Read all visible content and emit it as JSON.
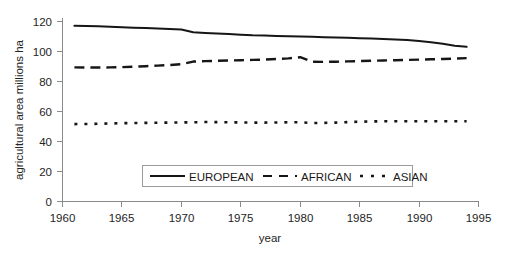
{
  "chart_data": {
    "type": "line",
    "title": "",
    "xlabel": "year",
    "ylabel": "agricultural area  millions ha",
    "xlim": [
      1960,
      1995
    ],
    "ylim": [
      0,
      120
    ],
    "xticks": [
      1960,
      1965,
      1970,
      1975,
      1980,
      1985,
      1990,
      1995
    ],
    "yticks": [
      0,
      20,
      40,
      60,
      80,
      100,
      120
    ],
    "grid": false,
    "legend_position": "lower-center-inside",
    "x": [
      1961,
      1962,
      1963,
      1964,
      1965,
      1966,
      1967,
      1968,
      1969,
      1970,
      1971,
      1972,
      1973,
      1974,
      1975,
      1976,
      1977,
      1978,
      1979,
      1980,
      1981,
      1982,
      1983,
      1984,
      1985,
      1986,
      1987,
      1988,
      1989,
      1990,
      1991,
      1992,
      1993,
      1994
    ],
    "series": [
      {
        "name": "EUROPEAN",
        "style": "solid",
        "values": [
          117.2,
          117.0,
          116.8,
          116.5,
          116.2,
          115.9,
          115.6,
          115.3,
          115.0,
          114.6,
          112.9,
          112.4,
          112.0,
          111.6,
          111.2,
          110.8,
          110.6,
          110.4,
          110.2,
          110.0,
          109.8,
          109.5,
          109.3,
          109.1,
          108.9,
          108.6,
          108.3,
          108.0,
          107.6,
          107.0,
          106.2,
          105.2,
          103.8,
          103.1
        ]
      },
      {
        "name": "AFRICAN",
        "style": "dashed",
        "values": [
          89.4,
          89.3,
          89.3,
          89.4,
          89.6,
          89.9,
          90.2,
          90.6,
          91.0,
          91.5,
          93.3,
          93.6,
          93.8,
          94.0,
          94.2,
          94.4,
          94.6,
          95.0,
          95.4,
          96.2,
          93.2,
          93.1,
          93.2,
          93.4,
          93.6,
          93.8,
          94.0,
          94.2,
          94.4,
          94.6,
          94.8,
          95.0,
          95.3,
          95.6
        ]
      },
      {
        "name": "ASIAN",
        "style": "dotted",
        "values": [
          51.6,
          51.7,
          51.8,
          52.0,
          52.2,
          52.3,
          52.4,
          52.5,
          52.6,
          52.7,
          52.8,
          53.0,
          52.9,
          52.8,
          52.7,
          52.6,
          52.6,
          52.7,
          52.8,
          52.9,
          52.3,
          52.4,
          52.6,
          52.9,
          53.2,
          53.4,
          53.5,
          53.5,
          53.5,
          53.5,
          53.5,
          53.5,
          53.5,
          53.5
        ]
      }
    ]
  },
  "axes": {
    "y_title": "agricultural area  millions ha",
    "x_title": "year",
    "y_tick_labels": [
      "120",
      "100",
      "80",
      "60",
      "40",
      "20",
      "0"
    ],
    "x_tick_labels": [
      "1960",
      "1965",
      "1970",
      "1975",
      "1980",
      "1985",
      "1990",
      "1995"
    ]
  },
  "legend": {
    "entries": [
      {
        "label": "EUROPEAN",
        "style": "solid"
      },
      {
        "label": "AFRICAN",
        "style": "dashed"
      },
      {
        "label": "ASIAN",
        "style": "dotted"
      }
    ]
  },
  "colors": {
    "series": "#161616",
    "axis": "#8a8a8a",
    "text": "#242424",
    "background": "#ffffff"
  }
}
